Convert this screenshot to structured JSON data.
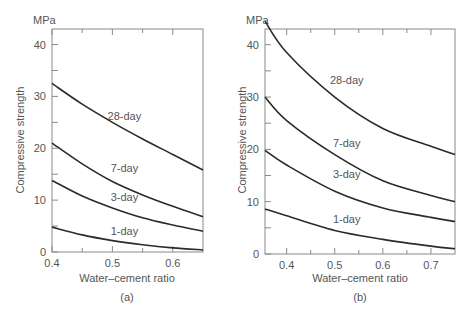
{
  "figure": {
    "panels": [
      {
        "id": "a",
        "caption": "(a)",
        "unit_label": "MPa",
        "ylabel": "Compressive strength",
        "xlabel": "Water–cement ratio",
        "xlim": [
          0.4,
          0.65
        ],
        "ylim": [
          0,
          43
        ],
        "xticks": [
          0.4,
          0.45,
          0.5,
          0.55,
          0.6
        ],
        "xtick_labels": [
          "0.4",
          "",
          "0.5",
          "",
          "0.6"
        ],
        "yticks": [
          0,
          5,
          10,
          15,
          20,
          25,
          30,
          35,
          40
        ],
        "ytick_labels": [
          "0",
          "",
          "10",
          "",
          "20",
          "",
          "30",
          "",
          "40"
        ]
      },
      {
        "id": "b",
        "caption": "(b)",
        "unit_label": "MPa",
        "ylabel": "Compressive strength",
        "xlabel": "Water–cement ratio",
        "xlim": [
          0.355,
          0.75
        ],
        "ylim": [
          0,
          43
        ],
        "xticks": [
          0.4,
          0.45,
          0.5,
          0.55,
          0.6,
          0.65,
          0.7
        ],
        "xtick_labels": [
          "0.4",
          "",
          "0.5",
          "",
          "0.6",
          "",
          "0.7"
        ],
        "yticks": [
          0,
          5,
          10,
          15,
          20,
          25,
          30,
          35,
          40
        ],
        "ytick_labels": [
          "0",
          "",
          "10",
          "",
          "20",
          "",
          "30",
          "",
          "40"
        ]
      }
    ]
  },
  "chart_data": [
    {
      "type": "line",
      "title": "(a)",
      "xlabel": "Water–cement ratio",
      "ylabel": "Compressive strength (MPa)",
      "xlim": [
        0.4,
        0.65
      ],
      "ylim": [
        0,
        43
      ],
      "grid": false,
      "legend": "inline labels",
      "x": [
        0.4,
        0.45,
        0.5,
        0.55,
        0.6,
        0.65
      ],
      "series": [
        {
          "name": "28-day",
          "values": [
            32.5,
            28.5,
            25.0,
            21.8,
            18.8,
            15.8
          ],
          "label_pos": [
            0.5,
            25.5
          ]
        },
        {
          "name": "7-day",
          "values": [
            21.0,
            17.0,
            13.6,
            11.0,
            8.8,
            6.8
          ],
          "label_pos": [
            0.5,
            15.5
          ]
        },
        {
          "name": "3-day",
          "values": [
            13.8,
            10.8,
            8.5,
            6.6,
            5.2,
            4.0
          ],
          "label_pos": [
            0.5,
            9.8
          ]
        },
        {
          "name": "1-day",
          "values": [
            4.8,
            3.3,
            2.2,
            1.4,
            0.8,
            0.4
          ],
          "label_pos": [
            0.5,
            3.3
          ]
        }
      ]
    },
    {
      "type": "line",
      "title": "(b)",
      "xlabel": "Water–cement ratio",
      "ylabel": "Compressive strength (MPa)",
      "xlim": [
        0.355,
        0.75
      ],
      "ylim": [
        0,
        43
      ],
      "grid": false,
      "legend": "inline labels",
      "x": [
        0.355,
        0.4,
        0.5,
        0.6,
        0.7,
        0.75
      ],
      "series": [
        {
          "name": "28-day",
          "values": [
            44.5,
            38.5,
            30.0,
            24.0,
            20.6,
            19.0
          ],
          "label_pos": [
            0.5,
            32.5
          ]
        },
        {
          "name": "7-day",
          "values": [
            30.0,
            25.5,
            19.0,
            14.0,
            11.2,
            10.0
          ],
          "label_pos": [
            0.5,
            20.5
          ]
        },
        {
          "name": "3-day",
          "values": [
            19.8,
            17.0,
            12.0,
            8.8,
            7.0,
            6.2
          ],
          "label_pos": [
            0.5,
            14.5
          ]
        },
        {
          "name": "1-day",
          "values": [
            8.6,
            7.3,
            4.5,
            2.8,
            1.5,
            1.0
          ],
          "label_pos": [
            0.5,
            6.0
          ]
        }
      ]
    }
  ]
}
